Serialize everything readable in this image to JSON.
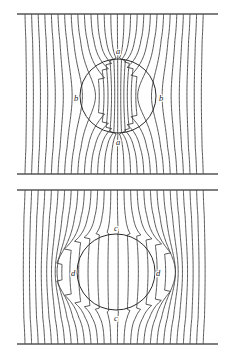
{
  "figure": {
    "background_color": "#ffffff",
    "line_color": "#3a3a3a",
    "rule_color": "#555555",
    "circle_color": "#2b2b2b",
    "label_color": "#1a1a1a",
    "width": 234,
    "height": 357
  },
  "chart_data": {
    "type": "line",
    "xlabel": "",
    "ylabel": "",
    "grid": false,
    "legend": "none",
    "panels": [
      {
        "name": "upper-panel",
        "description": "Uniform vertical field lines drawn into a circular body (flux concentration, high permeability)",
        "field_direction": "vertical",
        "body_shape": "circle",
        "body_center": [
          118,
          96
        ],
        "body_radius_x": 38,
        "body_radius_y": 37,
        "effect": "flux-concentration",
        "strength": 0.55,
        "line_count": 28,
        "line_spacing": 6.6,
        "line_x_start": 25,
        "line_x_end": 205,
        "rule_x_start": 17,
        "rule_x_end": 218,
        "rule_y_top": 14,
        "rule_y_bottom": 174,
        "labels": [
          {
            "text": "a",
            "x": 118,
            "y": 52,
            "position": "top"
          },
          {
            "text": "a",
            "x": 118,
            "y": 143,
            "position": "bottom"
          },
          {
            "text": "b",
            "x": 76,
            "y": 99,
            "position": "left"
          },
          {
            "text": "b",
            "x": 161,
            "y": 99,
            "position": "right"
          }
        ]
      },
      {
        "name": "lower-panel",
        "description": "Uniform vertical field lines expelled from a circular body (flux exclusion, diamagnetic)",
        "field_direction": "vertical",
        "body_shape": "circle",
        "body_center": [
          116,
          272
        ],
        "body_radius_x": 39,
        "body_radius_y": 38,
        "effect": "flux-exclusion",
        "strength": 0.55,
        "line_count": 28,
        "line_spacing": 6.6,
        "line_x_start": 25,
        "line_x_end": 205,
        "rule_x_start": 17,
        "rule_x_end": 218,
        "rule_y_top": 190,
        "rule_y_bottom": 344,
        "labels": [
          {
            "text": "c",
            "x": 116,
            "y": 229,
            "position": "top"
          },
          {
            "text": "c",
            "x": 116,
            "y": 319,
            "position": "bottom"
          },
          {
            "text": "d",
            "x": 73,
            "y": 274,
            "position": "left"
          },
          {
            "text": "d",
            "x": 158,
            "y": 274,
            "position": "right"
          }
        ]
      }
    ]
  }
}
